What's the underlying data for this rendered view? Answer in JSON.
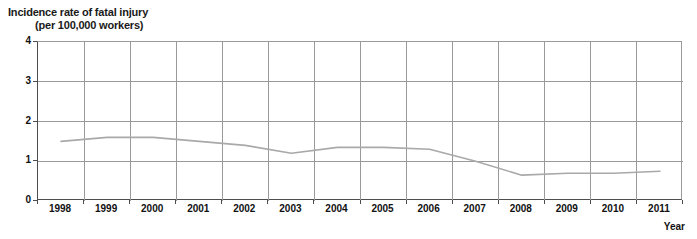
{
  "chart_data": {
    "type": "line",
    "title": "Incidence rate of fatal injury (per 100,000 workers)",
    "title_line1": "Incidence rate of fatal injury",
    "title_line2": "(per 100,000 workers)",
    "xlabel": "Year",
    "ylabel": "",
    "ylim": [
      0,
      4
    ],
    "yticks": [
      "0",
      "1",
      "2",
      "3",
      "4"
    ],
    "ytick_values": [
      0,
      1,
      2,
      3,
      4
    ],
    "grid": true,
    "legend": "none",
    "categories": [
      "1998",
      "1999",
      "2000",
      "2001",
      "2002",
      "2003",
      "2004",
      "2005",
      "2006",
      "2007",
      "2008",
      "2009",
      "2010",
      "2011"
    ],
    "values": [
      1.5,
      1.6,
      1.6,
      1.5,
      1.4,
      1.2,
      1.35,
      1.35,
      1.3,
      1.0,
      0.65,
      0.7,
      0.7,
      0.75
    ],
    "series": [
      {
        "name": "Incidence rate of fatal injury",
        "color": "#a9a9a9",
        "values": [
          1.5,
          1.6,
          1.6,
          1.5,
          1.4,
          1.2,
          1.35,
          1.35,
          1.3,
          1.0,
          0.65,
          0.7,
          0.7,
          0.75
        ]
      }
    ]
  },
  "colors": {
    "line": "#a9a9a9",
    "grid": "#9a9a9a",
    "axis": "#4d4d4d",
    "text": "#111111",
    "background": "#ffffff"
  }
}
